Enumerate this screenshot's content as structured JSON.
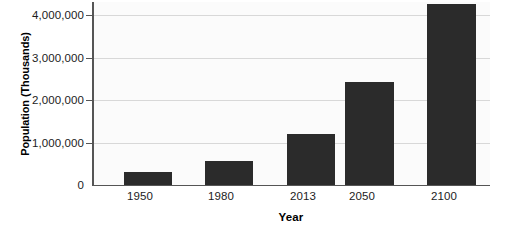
{
  "chart_data": {
    "type": "bar",
    "title": "",
    "xlabel": "Year",
    "ylabel": "Population (Thousands)",
    "categories": [
      "1950",
      "1980",
      "2013",
      "2050",
      "2100"
    ],
    "values": [
      300000,
      560000,
      1220000,
      2450000,
      4280000
    ],
    "ytick_labels": [
      "0",
      "1,000,000",
      "2,000,000",
      "3,000,000",
      "4,000,000"
    ],
    "ytick_values": [
      0,
      1000000,
      2000000,
      3000000,
      4000000
    ],
    "ylim": [
      0,
      4300000
    ],
    "grid": true,
    "legend": "none",
    "bar_color": "#2b2b2b",
    "grid_color": "#d8d8d8",
    "axis_color": "#555555",
    "plot_background": "#fbfbfb"
  }
}
